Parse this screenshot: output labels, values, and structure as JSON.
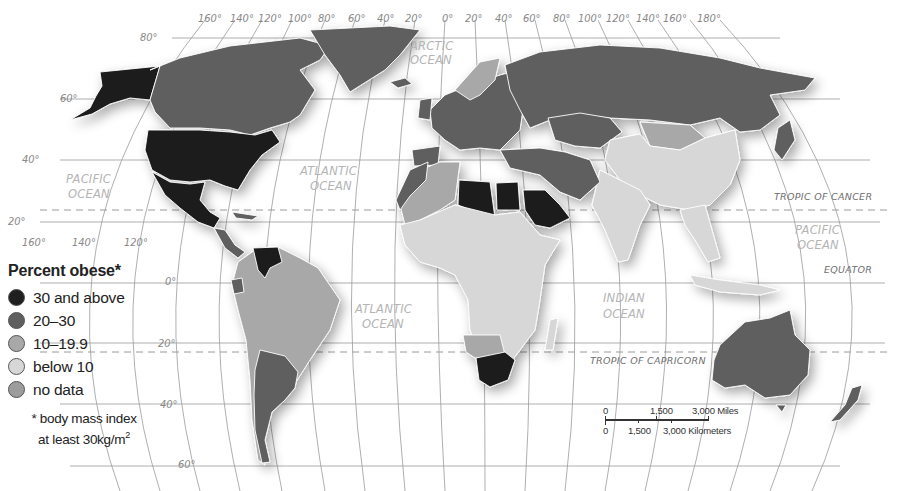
{
  "map": {
    "title": "Percent obese world map",
    "projection": "Robinson-style world projection with graticule",
    "top_longitude_labels": [
      "160°",
      "140°",
      "120°",
      "100°",
      "80°",
      "60°",
      "40°",
      "20°",
      "0°",
      "20°",
      "40°",
      "60°",
      "80°",
      "100°",
      "120°",
      "140°",
      "160°",
      "180°"
    ],
    "bottom_longitude_labels": [
      "160°",
      "140°",
      "120°"
    ],
    "latitude_labels": [
      "80°",
      "60°",
      "40°",
      "20°",
      "0°",
      "20°",
      "40°",
      "60°"
    ],
    "oceans": {
      "arctic": [
        "ARCTIC",
        "OCEAN"
      ],
      "atlantic_north": [
        "ATLANTIC",
        "OCEAN"
      ],
      "atlantic_south": [
        "ATLANTIC",
        "OCEAN"
      ],
      "pacific_west": [
        "PACIFIC",
        "OCEAN"
      ],
      "pacific_east": [
        "PACIFIC",
        "OCEAN"
      ],
      "indian": [
        "INDIAN",
        "OCEAN"
      ]
    },
    "reference_lines": {
      "tropic_of_cancer": "TROPIC OF CANCER",
      "equator": "EQUATOR",
      "tropic_of_capricorn": "TROPIC OF CAPRICORN"
    }
  },
  "legend": {
    "title": "Percent obese*",
    "items": [
      {
        "label": "30 and above",
        "color": "#1f1f1f"
      },
      {
        "label": "20–30",
        "color": "#5f5f5f"
      },
      {
        "label": "10–19.9",
        "color": "#a8a8a8"
      },
      {
        "label": "below 10",
        "color": "#d7d7d7"
      },
      {
        "label": "no data",
        "color": "#9c9c9c"
      }
    ],
    "footnote_line1": "* body mass index",
    "footnote_line2": "at least 30kg/m",
    "footnote_sup": "2"
  },
  "scale_bar": {
    "miles_labels": [
      "0",
      "1,500",
      "3,000 Miles"
    ],
    "km_labels": [
      "0",
      "1,500",
      "3,000 Kilometers"
    ]
  },
  "regions": {
    "30_and_above": [
      "Alaska/United States",
      "Mexico",
      "Venezuela",
      "Libya",
      "Egypt",
      "Saudi Arabia",
      "South Africa",
      "Syria"
    ],
    "20_30": [
      "Canada",
      "Greenland",
      "Russia",
      "Kazakhstan",
      "Turkey",
      "Iran",
      "Argentina",
      "Chile",
      "Australia",
      "New Zealand",
      "Europe (most)",
      "Spain",
      "United Kingdom",
      "Morocco",
      "Ecuador"
    ],
    "10_19_9": [
      "Brazil",
      "Peru",
      "Bolivia",
      "Colombia",
      "Algeria",
      "Mongolia",
      "Namibia",
      "Botswana",
      "Western Europe (part)"
    ],
    "below_10": [
      "China",
      "India",
      "Southeast Asia",
      "Sub-Saharan Africa"
    ]
  }
}
